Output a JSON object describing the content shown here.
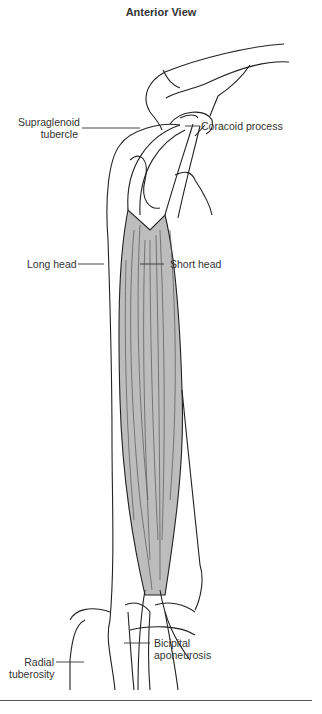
{
  "title": "Anterior View",
  "labels": {
    "supraglenoid_1": "Supraglenoid",
    "supraglenoid_2": "tubercle",
    "coracoid": "Coracoid process",
    "long_head": "Long head",
    "short_head": "Short head",
    "radial_1": "Radial",
    "radial_2": "tuberosity",
    "bicipital_1": "Bicipital",
    "bicipital_2": "aponeurosis"
  },
  "colors": {
    "muscle_fill": "#bdbdbd",
    "line": "#222222",
    "background": "#ffffff"
  }
}
